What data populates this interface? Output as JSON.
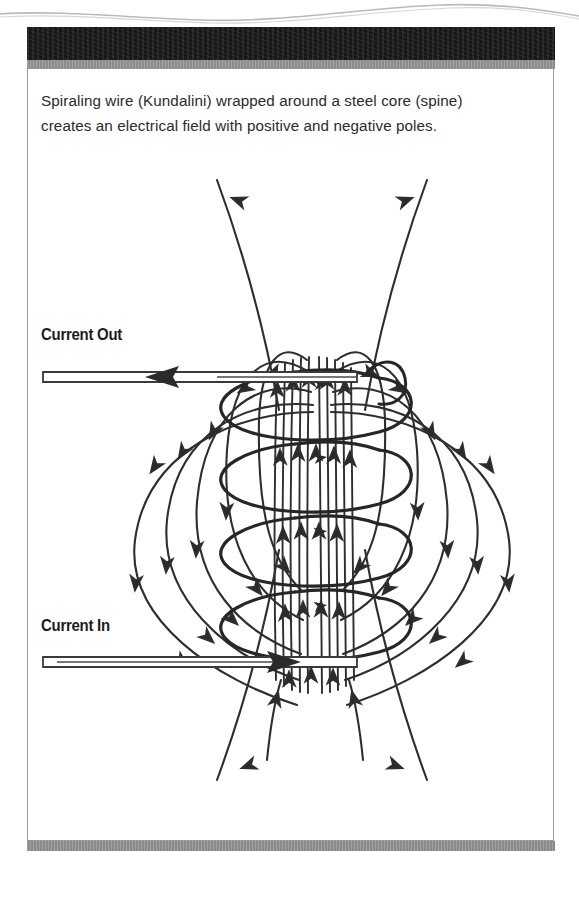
{
  "figure": {
    "caption_line_1": "Spiraling wire (Kundalini) wrapped around a steel core (spine)",
    "caption_line_2": "creates an electrical field with positive and negative poles.",
    "caption_full": "Spiraling wire (Kundalini) wrapped around a steel core (spine) creates an electrical field with positive and negative poles."
  },
  "diagram": {
    "labels": {
      "current_out": "Current Out",
      "current_in": "Current In"
    },
    "elements": {
      "core_label": "steel core (spine)",
      "coil_label": "spiraling wire (Kundalini)",
      "coil_turns": 4,
      "field_loop_count": 5,
      "lead_out_direction": "left",
      "lead_in_direction": "right",
      "interior_field_direction": "up",
      "exterior_field_direction": "down"
    }
  },
  "colors": {
    "ink": "#1c1c1c",
    "header_bar": "#171717",
    "rule_gray": "#8d8d8d",
    "frame": "#9a9a9a",
    "paper": "#ffffff",
    "caption_text": "#2b2b2b"
  }
}
